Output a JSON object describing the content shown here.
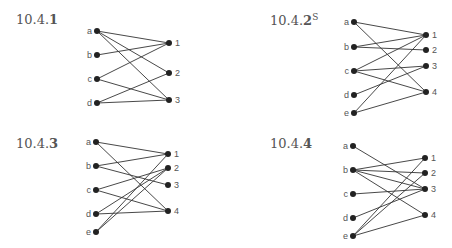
{
  "graphs": [
    {
      "id": "10.4.1",
      "title_prefix": "10.4.",
      "title_bold": "1",
      "title_sup": "",
      "label_pos": [
        16,
        12
      ],
      "left": [
        {
          "name": "a",
          "x": 97,
          "y": 31
        },
        {
          "name": "b",
          "x": 97,
          "y": 55
        },
        {
          "name": "c",
          "x": 97,
          "y": 79
        },
        {
          "name": "d",
          "x": 97,
          "y": 103
        }
      ],
      "right": [
        {
          "name": "1",
          "x": 169,
          "y": 43
        },
        {
          "name": "2",
          "x": 169,
          "y": 73
        },
        {
          "name": "3",
          "x": 169,
          "y": 100
        }
      ],
      "edges": [
        [
          "a",
          "1"
        ],
        [
          "a",
          "2"
        ],
        [
          "a",
          "3"
        ],
        [
          "b",
          "1"
        ],
        [
          "c",
          "1"
        ],
        [
          "c",
          "3"
        ],
        [
          "d",
          "2"
        ],
        [
          "d",
          "3"
        ]
      ]
    },
    {
      "id": "10.4.2S",
      "title_prefix": "10.4.",
      "title_bold": "2",
      "title_sup": "S",
      "label_pos": [
        270,
        12
      ],
      "left": [
        {
          "name": "a",
          "x": 354,
          "y": 22
        },
        {
          "name": "b",
          "x": 354,
          "y": 47
        },
        {
          "name": "c",
          "x": 354,
          "y": 71
        },
        {
          "name": "d",
          "x": 354,
          "y": 95
        },
        {
          "name": "e",
          "x": 354,
          "y": 113
        }
      ],
      "right": [
        {
          "name": "1",
          "x": 426,
          "y": 35
        },
        {
          "name": "2",
          "x": 426,
          "y": 50
        },
        {
          "name": "3",
          "x": 426,
          "y": 66
        },
        {
          "name": "4",
          "x": 426,
          "y": 92
        }
      ],
      "edges": [
        [
          "a",
          "1"
        ],
        [
          "a",
          "4"
        ],
        [
          "b",
          "1"
        ],
        [
          "b",
          "2"
        ],
        [
          "c",
          "1"
        ],
        [
          "c",
          "3"
        ],
        [
          "c",
          "4"
        ],
        [
          "d",
          "3"
        ],
        [
          "e",
          "1"
        ],
        [
          "e",
          "4"
        ]
      ]
    },
    {
      "id": "10.4.3",
      "title_prefix": "10.4.",
      "title_bold": "3",
      "title_sup": "",
      "label_pos": [
        16,
        136
      ],
      "left": [
        {
          "name": "a",
          "x": 96,
          "y": 142
        },
        {
          "name": "b",
          "x": 96,
          "y": 166
        },
        {
          "name": "c",
          "x": 96,
          "y": 190
        },
        {
          "name": "d",
          "x": 96,
          "y": 214
        },
        {
          "name": "e",
          "x": 96,
          "y": 232
        }
      ],
      "right": [
        {
          "name": "1",
          "x": 168,
          "y": 154
        },
        {
          "name": "2",
          "x": 168,
          "y": 168
        },
        {
          "name": "3",
          "x": 168,
          "y": 185
        },
        {
          "name": "4",
          "x": 168,
          "y": 211
        }
      ],
      "edges": [
        [
          "a",
          "1"
        ],
        [
          "a",
          "4"
        ],
        [
          "b",
          "1"
        ],
        [
          "b",
          "3"
        ],
        [
          "c",
          "2"
        ],
        [
          "c",
          "4"
        ],
        [
          "d",
          "2"
        ],
        [
          "d",
          "4"
        ],
        [
          "e",
          "1"
        ],
        [
          "e",
          "2"
        ]
      ]
    },
    {
      "id": "10.4.4",
      "title_prefix": "10.4.",
      "title_bold": "4",
      "title_sup": "",
      "label_pos": [
        270,
        136
      ],
      "left": [
        {
          "name": "a",
          "x": 353,
          "y": 146
        },
        {
          "name": "b",
          "x": 353,
          "y": 170
        },
        {
          "name": "c",
          "x": 353,
          "y": 194
        },
        {
          "name": "d",
          "x": 353,
          "y": 218
        },
        {
          "name": "e",
          "x": 353,
          "y": 236
        }
      ],
      "right": [
        {
          "name": "1",
          "x": 425,
          "y": 158
        },
        {
          "name": "2",
          "x": 425,
          "y": 173
        },
        {
          "name": "3",
          "x": 425,
          "y": 189
        },
        {
          "name": "4",
          "x": 425,
          "y": 215
        }
      ],
      "edges": [
        [
          "a",
          "3"
        ],
        [
          "b",
          "1"
        ],
        [
          "b",
          "2"
        ],
        [
          "b",
          "3"
        ],
        [
          "b",
          "4"
        ],
        [
          "c",
          "3"
        ],
        [
          "d",
          "3"
        ],
        [
          "e",
          "1"
        ],
        [
          "e",
          "2"
        ],
        [
          "e",
          "4"
        ]
      ]
    }
  ],
  "style": {
    "edge_color": "#333333",
    "node_color": "#222222",
    "label_color": "#555555"
  }
}
